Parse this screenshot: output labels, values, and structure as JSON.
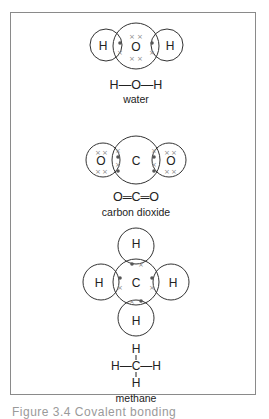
{
  "figure": {
    "caption": "Figure 3.4  Covalent bonding",
    "molecules": [
      {
        "id": "water",
        "name": "water",
        "structural_formula": "H—O—H",
        "atoms": [
          {
            "symbol": "H",
            "cx": 106,
            "cy": 45,
            "r": 16,
            "label_x": 103,
            "label_y": 50
          },
          {
            "symbol": "O",
            "cx": 136,
            "cy": 46,
            "r": 23,
            "label_x": 136,
            "label_y": 51
          },
          {
            "symbol": "H",
            "cx": 167,
            "cy": 45,
            "r": 16,
            "label_x": 170,
            "label_y": 50
          }
        ],
        "lone_pairs": [
          {
            "symbol": "×",
            "x": 132,
            "y": 36
          },
          {
            "symbol": "×",
            "x": 140,
            "y": 36
          },
          {
            "symbol": "×",
            "x": 132,
            "y": 58
          },
          {
            "symbol": "×",
            "x": 140,
            "y": 58
          }
        ],
        "shared": [
          {
            "symbol": "•",
            "x": 120,
            "y": 43
          },
          {
            "symbol": "×",
            "x": 120,
            "y": 52
          },
          {
            "symbol": "•",
            "x": 152,
            "y": 43
          },
          {
            "symbol": "×",
            "x": 152,
            "y": 52
          }
        ]
      },
      {
        "id": "carbon-dioxide",
        "name": "carbon dioxide",
        "structural_formula": "O═C═O",
        "atoms": [
          {
            "symbol": "O",
            "cx": 103,
            "cy": 160,
            "r": 17,
            "label_x": 101,
            "label_y": 165
          },
          {
            "symbol": "C",
            "cx": 136,
            "cy": 160,
            "r": 24,
            "label_x": 136,
            "label_y": 165
          },
          {
            "symbol": "O",
            "cx": 169,
            "cy": 160,
            "r": 17,
            "label_x": 171,
            "label_y": 165
          }
        ],
        "lone_pairs": [
          {
            "symbol": "×",
            "x": 98,
            "y": 152
          },
          {
            "symbol": "×",
            "x": 105,
            "y": 152
          },
          {
            "symbol": "×",
            "x": 98,
            "y": 171
          },
          {
            "symbol": "×",
            "x": 105,
            "y": 171
          },
          {
            "symbol": "×",
            "x": 167,
            "y": 152
          },
          {
            "symbol": "×",
            "x": 174,
            "y": 152
          },
          {
            "symbol": "×",
            "x": 167,
            "y": 171
          },
          {
            "symbol": "×",
            "x": 174,
            "y": 171
          }
        ],
        "shared": [
          {
            "symbol": "×",
            "x": 118,
            "y": 150
          },
          {
            "symbol": "•",
            "x": 118,
            "y": 157
          },
          {
            "symbol": "×",
            "x": 118,
            "y": 164
          },
          {
            "symbol": "•",
            "x": 118,
            "y": 171
          },
          {
            "symbol": "×",
            "x": 154,
            "y": 150
          },
          {
            "symbol": "•",
            "x": 154,
            "y": 157
          },
          {
            "symbol": "×",
            "x": 154,
            "y": 164
          },
          {
            "symbol": "•",
            "x": 154,
            "y": 171
          }
        ]
      },
      {
        "id": "methane",
        "name": "methane",
        "structural_formula": {
          "top": "H",
          "middle": "H—C—H",
          "bottom": "H"
        },
        "atoms": [
          {
            "symbol": "H",
            "cx": 136,
            "cy": 246,
            "r": 18,
            "label_x": 136,
            "label_y": 248
          },
          {
            "symbol": "H",
            "cx": 101,
            "cy": 282,
            "r": 18,
            "label_x": 99,
            "label_y": 287
          },
          {
            "symbol": "C",
            "cx": 136,
            "cy": 282,
            "r": 23,
            "label_x": 136,
            "label_y": 287
          },
          {
            "symbol": "H",
            "cx": 171,
            "cy": 282,
            "r": 18,
            "label_x": 173,
            "label_y": 287
          },
          {
            "symbol": "H",
            "cx": 136,
            "cy": 318,
            "r": 18,
            "label_x": 136,
            "label_y": 325
          }
        ],
        "lone_pairs": [],
        "shared": [
          {
            "symbol": "•",
            "x": 132,
            "y": 264
          },
          {
            "symbol": "×",
            "x": 141,
            "y": 264
          },
          {
            "symbol": "•",
            "x": 120,
            "y": 278
          },
          {
            "symbol": "×",
            "x": 120,
            "y": 287
          },
          {
            "symbol": "•",
            "x": 152,
            "y": 278
          },
          {
            "symbol": "×",
            "x": 152,
            "y": 287
          },
          {
            "symbol": "×",
            "x": 132,
            "y": 301
          },
          {
            "symbol": "•",
            "x": 141,
            "y": 301
          }
        ]
      }
    ]
  }
}
